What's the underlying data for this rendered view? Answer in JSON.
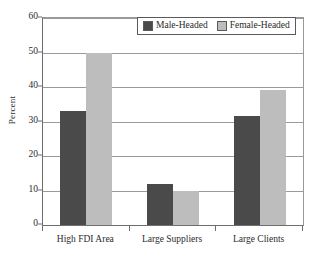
{
  "chart_data": {
    "type": "bar",
    "title": "",
    "xlabel": "",
    "ylabel": "Percent",
    "ylim": [
      0,
      60
    ],
    "yticks": [
      0,
      10,
      20,
      30,
      40,
      50,
      60
    ],
    "grid": true,
    "legend_position": "top-center",
    "categories": [
      "High FDI Area",
      "Large Suppliers",
      "Large Clients"
    ],
    "series": [
      {
        "name": "Male-Headed",
        "color": "#4a4a4a",
        "values": [
          33,
          12,
          31.5
        ]
      },
      {
        "name": "Female-Headed",
        "color": "#bdbdbd",
        "values": [
          50,
          10,
          39
        ]
      }
    ]
  },
  "colors": {
    "male": "#4a4a4a",
    "female": "#bdbdbd",
    "axis": "#6e6e6e",
    "grid": "#9a9a9a",
    "background": "#ffffff"
  }
}
